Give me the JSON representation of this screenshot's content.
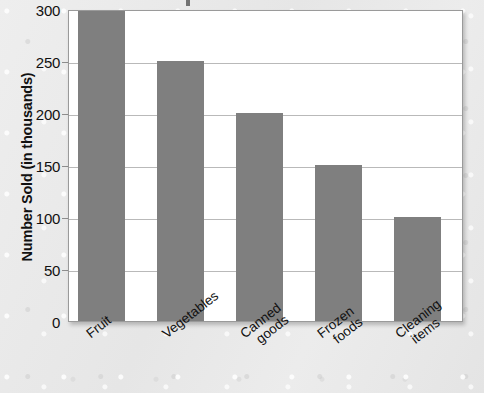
{
  "chart_data": {
    "type": "bar",
    "title": "",
    "xlabel": "",
    "ylabel": "Number Sold (in thousands)",
    "categories": [
      "Fruit",
      "Vegetables",
      "Canned goods",
      "Frozen foods",
      "Cleaning items"
    ],
    "category_lines": [
      [
        "Fruit"
      ],
      [
        "Vegetables"
      ],
      [
        "Canned",
        "goods"
      ],
      [
        "Frozen",
        "foods"
      ],
      [
        "Cleaning",
        "items"
      ]
    ],
    "values": [
      300,
      250,
      200,
      150,
      100
    ],
    "ylim": [
      0,
      300
    ],
    "ytick_labels": [
      "0",
      "50",
      "100",
      "150",
      "200",
      "250",
      "300"
    ],
    "yticks": [
      0,
      50,
      100,
      150,
      200,
      250,
      300
    ],
    "grid": true,
    "legend": "none",
    "bar_color": "#7f7f7f",
    "plot_background": "#ffffff",
    "gridline_color": "#b9b9b9",
    "frame_color": "#9a9a9a",
    "page_background": "#e9e9e9"
  }
}
